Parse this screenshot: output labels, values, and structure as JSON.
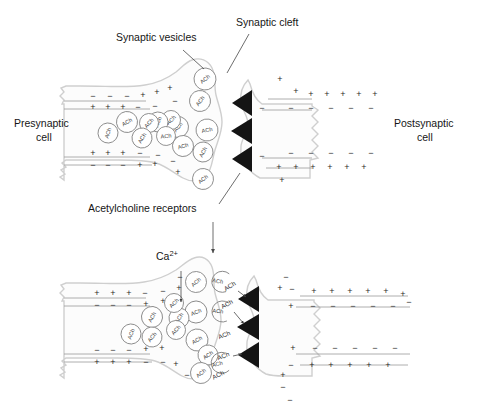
{
  "figure": {
    "background_color": "#ffffff",
    "ink_color": "#161616",
    "receptor_color": "#141414",
    "membrane_color": "#9b9b9b",
    "cell_outline_color": "#cfcfcf",
    "vesicle_stroke_color": "#7d7d7d"
  },
  "labels": {
    "synaptic_vesicles": "Synaptic vesicles",
    "synaptic_cleft": "Synaptic cleft",
    "acetylcholine_receptors": "Acetylcholine receptors",
    "presynaptic_cell_line1": "Presynaptic",
    "presynaptic_cell_line2": "cell",
    "postsynaptic_cell_line1": "Postsynaptic",
    "postsynaptic_cell_line2": "cell",
    "calcium_ion": "Ca",
    "calcium_ion_charge": "2+",
    "vesicle_content": "ACh"
  },
  "panels": [
    {
      "id": "resting",
      "name": "upper-panel-resting-state",
      "presynaptic_membrane": {
        "top_outer_charges": [
          "−",
          "−",
          "−",
          "+",
          "+",
          "+"
        ],
        "top_inner_charges": [
          "+",
          "+",
          "+",
          "−",
          "−",
          "−"
        ],
        "bottom_inner_charges": [
          "+",
          "+",
          "+",
          "−",
          "−"
        ],
        "bottom_outer_charges": [
          "−",
          "−",
          "−",
          "+",
          "+",
          "−",
          "+"
        ]
      },
      "postsynaptic_membrane": {
        "top_outer_charges": [
          "+",
          "+",
          "+",
          "+",
          "+",
          "+",
          "+"
        ],
        "top_inner_charges": [
          "−",
          "−",
          "−",
          "−",
          "−",
          "−"
        ],
        "bottom_inner_charges": [
          "−",
          "−",
          "−",
          "−",
          "−",
          "−"
        ],
        "bottom_outer_charges": [
          "+",
          "+",
          "+",
          "+",
          "+",
          "+",
          "+"
        ]
      },
      "receptor_count": 3,
      "vesicle_count": 14,
      "free_ach_count": 0
    },
    {
      "id": "release",
      "name": "lower-panel-transmitter-release",
      "presynaptic_membrane": {
        "top_outer_charges": [
          "+",
          "+",
          "+",
          "−",
          "−",
          "+"
        ],
        "top_inner_charges": [
          "−",
          "−",
          "−",
          "+",
          "+"
        ],
        "bottom_inner_charges": [
          "−",
          "−",
          "−",
          "+",
          "+"
        ],
        "bottom_outer_charges": [
          "+",
          "+",
          "+",
          "−",
          "−",
          "+",
          "−"
        ]
      },
      "postsynaptic_membrane": {
        "top_outer_charges": [
          "+",
          "+",
          "+",
          "+",
          "+",
          "+"
        ],
        "top_inner_charges": [
          "−",
          "−",
          "−",
          "−",
          "−",
          "−"
        ],
        "bottom_inner_charges": [
          "−",
          "−",
          "−",
          "−",
          "−",
          "−"
        ],
        "bottom_outer_charges": [
          "+",
          "+",
          "+",
          "+",
          "+",
          "+"
        ]
      },
      "receptor_count": 3,
      "vesicle_count": 12,
      "free_ach_count": 6
    }
  ],
  "icons": {
    "receptor": "receptor-triangle-icon",
    "vesicle": "vesicle-circle-icon",
    "open_vesicle": "fusing-vesicle-arc-icon",
    "panel_flow": "downward-arrow-icon",
    "calcium_influx": "calcium-influx-arrow-icon",
    "diffusion": "ach-diffusion-arrow-icon"
  }
}
